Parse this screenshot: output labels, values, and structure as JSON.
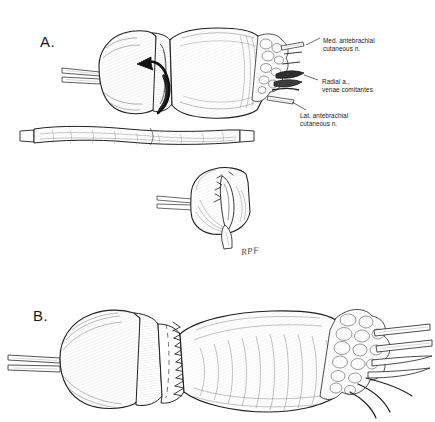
{
  "figure": {
    "background_color": "#ffffff",
    "ink_color": "#1a1a1a",
    "shading_color": "#555555",
    "width": 435,
    "height": 422
  },
  "panels": [
    {
      "id": "panel-a",
      "letter": "A.",
      "description": "Forearm segment with transverse incision, black curved arrow indicating tunneling direction, cut distal surface exposing neurovascular structures"
    },
    {
      "id": "panel-b",
      "letter": "B.",
      "description": "Closed forearm segment with running suture line along the repaired incision and distal fatty tissue with emerging vessels and nerves"
    }
  ],
  "callouts": [
    {
      "id": "med-antebrachial",
      "text": "Med. antebrachial\ncutaneous n."
    },
    {
      "id": "radial-artery",
      "text": "Radial a.,\nvenae comitantes"
    },
    {
      "id": "lat-antebrachial",
      "text": "Lat. antebrachial\ncutaneous n."
    }
  ],
  "signature": {
    "text": "RPF"
  }
}
